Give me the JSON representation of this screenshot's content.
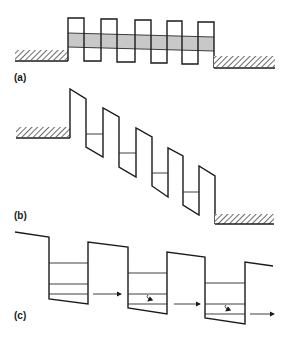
{
  "figure": {
    "colors": {
      "line": "#1a1a1a",
      "miniband": "#c8c8c8",
      "background": "#ffffff"
    },
    "panels": [
      {
        "id": "a",
        "label": "(a)",
        "content": "Unbiased superlattice between two contacts with a shaded miniband",
        "wells": 4,
        "barriers": 5
      },
      {
        "id": "b",
        "label": "(b)",
        "content": "Biased superlattice (tilted bands) with one confined level per well, contacts offset",
        "wells": 4,
        "barriers": 5
      },
      {
        "id": "c",
        "label": "(c)",
        "content": "Biased wells with three levels each; horizontal tunneling arrows and wavy relaxation arrows",
        "wells": 3,
        "levels_per_well": 3
      }
    ]
  }
}
